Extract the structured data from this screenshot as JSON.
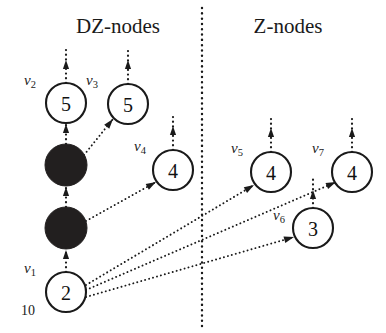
{
  "figure": {
    "headers": [
      {
        "id": "dz",
        "label": "DZ-nodes",
        "x": 118,
        "y": 28
      },
      {
        "id": "z",
        "label": "Z-nodes",
        "x": 288,
        "y": 28
      }
    ],
    "divider": {
      "x": 202,
      "y_top": 8,
      "y_bottom": 326,
      "style": "dotted"
    },
    "nodes": [
      {
        "id": "v1",
        "label": "v",
        "sub": "1",
        "value": "2",
        "cx": 66,
        "cy": 292,
        "r": 20,
        "filled": false,
        "label_x": 30,
        "label_y": 268
      },
      {
        "id": "v2",
        "label": "v",
        "sub": "2",
        "value": "5",
        "cx": 66,
        "cy": 103,
        "r": 20,
        "filled": false,
        "label_x": 30,
        "label_y": 80
      },
      {
        "id": "v3",
        "label": "v",
        "sub": "3",
        "value": "5",
        "cx": 128,
        "cy": 104,
        "r": 20,
        "filled": false,
        "label_x": 92,
        "label_y": 80
      },
      {
        "id": "v4",
        "label": "v",
        "sub": "4",
        "value": "4",
        "cx": 173,
        "cy": 170,
        "r": 20,
        "filled": false,
        "label_x": 140,
        "label_y": 146
      },
      {
        "id": "v5",
        "label": "v",
        "sub": "5",
        "value": "4",
        "cx": 271,
        "cy": 172,
        "r": 20,
        "filled": false,
        "label_x": 237,
        "label_y": 148
      },
      {
        "id": "v6",
        "label": "v",
        "sub": "6",
        "value": "3",
        "cx": 313,
        "cy": 228,
        "r": 20,
        "filled": false,
        "label_x": 279,
        "label_y": 215
      },
      {
        "id": "v7",
        "label": "v",
        "sub": "7",
        "value": "4",
        "cx": 352,
        "cy": 172,
        "r": 20,
        "filled": false,
        "label_x": 318,
        "label_y": 148
      }
    ],
    "filled_nodes": [
      {
        "id": "b1",
        "cx": 66,
        "cy": 165,
        "r": 21
      },
      {
        "id": "b2",
        "cx": 66,
        "cy": 228,
        "r": 21
      }
    ],
    "weight_labels": [
      {
        "id": "w1",
        "text": "10",
        "x": 28,
        "y": 310
      }
    ],
    "chain_edges": [
      {
        "id": "e-v1-b2",
        "x1": 66,
        "y1": 272,
        "x2": 66,
        "y2": 250
      },
      {
        "id": "e-b2-b1",
        "x1": 66,
        "y1": 207,
        "x2": 66,
        "y2": 187
      },
      {
        "id": "e-b1-v2",
        "x1": 66,
        "y1": 144,
        "x2": 66,
        "y2": 124
      }
    ],
    "stub_edges": [
      {
        "id": "stub-v2",
        "x1": 66,
        "y1": 83,
        "x2": 66,
        "y2": 48
      },
      {
        "id": "stub-v3",
        "x1": 128,
        "y1": 84,
        "x2": 128,
        "y2": 48
      },
      {
        "id": "stub-v4",
        "x1": 173,
        "y1": 150,
        "x2": 173,
        "y2": 114
      },
      {
        "id": "stub-v5",
        "x1": 271,
        "y1": 152,
        "x2": 271,
        "y2": 116
      },
      {
        "id": "stub-v7",
        "x1": 352,
        "y1": 152,
        "x2": 352,
        "y2": 116
      },
      {
        "id": "stub-v6",
        "x1": 313,
        "y1": 208,
        "x2": 313,
        "y2": 178
      }
    ],
    "cross_edges": [
      {
        "id": "e-b1-v3",
        "x1": 84,
        "y1": 155,
        "x2": 113,
        "y2": 119
      },
      {
        "id": "e-b2-v4",
        "x1": 86,
        "y1": 221,
        "x2": 156,
        "y2": 182
      },
      {
        "id": "e-v1-v5",
        "x1": 86,
        "y1": 285,
        "x2": 254,
        "y2": 185
      },
      {
        "id": "e-v1-v7",
        "x1": 86,
        "y1": 290,
        "x2": 336,
        "y2": 182
      },
      {
        "id": "e-v1-v6",
        "x1": 86,
        "y1": 297,
        "x2": 294,
        "y2": 237
      }
    ]
  }
}
